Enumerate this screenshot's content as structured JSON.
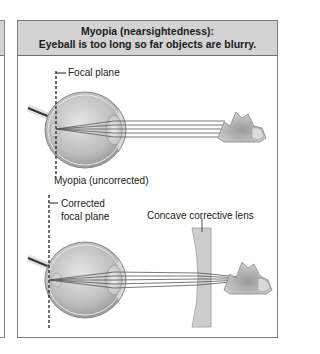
{
  "panel": {
    "title_line1": "Myopia (nearsightedness):",
    "title_line2": "Eyeball is too long so far objects are blurry."
  },
  "top_diagram": {
    "focal_label": "Focal plane",
    "caption": "Myopia (uncorrected)"
  },
  "bottom_diagram": {
    "focal_label_line1": "Corrected",
    "focal_label_line2": "focal plane",
    "lens_label": "Concave corrective lens"
  },
  "colors": {
    "header_bg": "#d3d3d3",
    "border": "#7d7d7d",
    "eye_fill": "#c8c8c8",
    "lens_fill": "#cfcfcf",
    "ray": "#555555"
  }
}
